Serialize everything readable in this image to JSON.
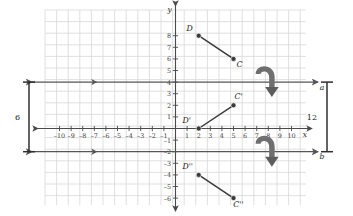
{
  "figure": {
    "kind": "coordinate-plane-reflection-diagram",
    "background_color": "#ffffff",
    "grid_color": "#d8d8d8",
    "axis_color": "#4a4a4a",
    "segment_color": "#3a3a3a",
    "point_color": "#3a3a3a",
    "line_color": "#555555",
    "arrow_color": "#6f6f6f"
  },
  "axes": {
    "x_label": "x",
    "y_label": "y",
    "x_ticks": [
      "-10",
      "-9",
      "-8",
      "-7",
      "-6",
      "-5",
      "-4",
      "-3",
      "-2",
      "-1",
      "1",
      "2",
      "3",
      "4",
      "5",
      "6",
      "7",
      "8",
      "9",
      "10"
    ],
    "y_ticks": [
      "8",
      "7",
      "6",
      "5",
      "4",
      "3",
      "2",
      "1",
      "-1",
      "-2",
      "-3",
      "-4",
      "-5",
      "-6"
    ],
    "xlim": [
      -11,
      11
    ],
    "ylim": [
      -7,
      9
    ]
  },
  "lines": [
    {
      "name": "a",
      "label": "a",
      "y": 4
    },
    {
      "name": "b",
      "label": "b",
      "y": -2
    }
  ],
  "points": [
    {
      "label": "D",
      "x": 2,
      "y": 8,
      "label_dx": -9,
      "label_dy": -5
    },
    {
      "label": "C",
      "x": 5,
      "y": 6,
      "label_dx": 6,
      "label_dy": 8
    },
    {
      "label": "D'",
      "x": 2,
      "y": 0,
      "label_dx": -12,
      "label_dy": -6
    },
    {
      "label": "C'",
      "x": 5,
      "y": 2,
      "label_dx": 5,
      "label_dy": -6
    },
    {
      "label": "D''",
      "x": 2,
      "y": -4,
      "label_dx": -11,
      "label_dy": -6
    },
    {
      "label": "C''",
      "x": 5,
      "y": -6,
      "label_dx": 5,
      "label_dy": 9
    }
  ],
  "segments": [
    {
      "name": "segment-DC",
      "from": "D",
      "to": "C"
    },
    {
      "name": "segment-D1C1",
      "from": "D'",
      "to": "C'"
    },
    {
      "name": "segment-D2C2",
      "from": "D''",
      "to": "C''"
    }
  ],
  "brackets": [
    {
      "name": "left-bracket",
      "label": "6",
      "side": "left",
      "from_y": 4,
      "to_y": -2
    },
    {
      "name": "right-bracket",
      "label": "12",
      "side": "right",
      "from_y": 4,
      "to_y": -2
    }
  ],
  "flip_arrows": [
    {
      "name": "flip-arrow-line-a",
      "at_y": 4
    },
    {
      "name": "flip-arrow-line-b",
      "at_y": -2
    }
  ]
}
